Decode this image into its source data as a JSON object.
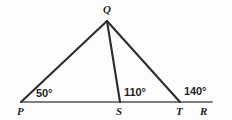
{
  "figure": {
    "kind": "geometry-diagram",
    "width": 232,
    "height": 120,
    "background_color": "#fdfdfd",
    "line_color": "#2d2d2d",
    "baseline_color": "#54545a",
    "text_color": "#1f1f1f"
  },
  "points": {
    "P": {
      "label": "P",
      "x": 21,
      "y": 102,
      "label_x": 17,
      "label_y": 106
    },
    "Q": {
      "label": "Q",
      "x": 107,
      "y": 21,
      "label_x": 103,
      "label_y": 4
    },
    "S": {
      "label": "S",
      "x": 120,
      "y": 102,
      "label_x": 116,
      "label_y": 106
    },
    "T": {
      "label": "T",
      "x": 180,
      "y": 102,
      "label_x": 176,
      "label_y": 106
    },
    "R": {
      "label": "R",
      "x": 212,
      "y": 102,
      "label_x": 200,
      "label_y": 106
    }
  },
  "segments": [
    {
      "name": "base-line-PR",
      "from": "P",
      "to": "R"
    },
    {
      "name": "segment-QP",
      "from": "Q",
      "to": "P"
    },
    {
      "name": "segment-QS",
      "from": "Q",
      "to": "S"
    },
    {
      "name": "segment-QT",
      "from": "Q",
      "to": "T"
    }
  ],
  "angles": [
    {
      "name": "angle-at-P",
      "vertex": "P",
      "text": "50°",
      "value": 50,
      "x": 36,
      "y": 88
    },
    {
      "name": "angle-at-S",
      "vertex": "S",
      "text": "110°",
      "value": 110,
      "x": 124,
      "y": 87
    },
    {
      "name": "angle-at-T",
      "vertex": "T",
      "text": "140°",
      "value": 140,
      "x": 184,
      "y": 86
    }
  ]
}
